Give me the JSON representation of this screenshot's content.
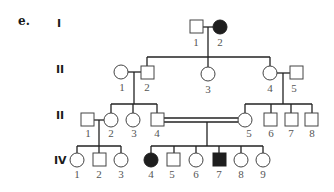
{
  "figure": {
    "part_label": "e.",
    "generations": [
      "I",
      "II",
      "II",
      "IV"
    ],
    "colors": {
      "affected": "#1e1e1e",
      "unaffected": "#ffffff",
      "line": "#222222"
    }
  },
  "gen1": {
    "members": [
      {
        "num": "1",
        "sex": "male",
        "affected": false
      },
      {
        "num": "2",
        "sex": "female",
        "affected": true
      }
    ]
  },
  "gen2": {
    "members": [
      {
        "num": "1",
        "sex": "female",
        "affected": false
      },
      {
        "num": "2",
        "sex": "male",
        "affected": false
      },
      {
        "num": "3",
        "sex": "female",
        "affected": false
      },
      {
        "num": "4",
        "sex": "female",
        "affected": false
      },
      {
        "num": "5",
        "sex": "male",
        "affected": false
      }
    ]
  },
  "gen3": {
    "members": [
      {
        "num": "1",
        "sex": "male",
        "affected": false
      },
      {
        "num": "2",
        "sex": "female",
        "affected": false
      },
      {
        "num": "3",
        "sex": "female",
        "affected": false
      },
      {
        "num": "4",
        "sex": "male",
        "affected": false
      },
      {
        "num": "5",
        "sex": "female",
        "affected": false
      },
      {
        "num": "6",
        "sex": "male",
        "affected": false
      },
      {
        "num": "7",
        "sex": "male",
        "affected": false
      },
      {
        "num": "8",
        "sex": "male",
        "affected": false
      }
    ],
    "consanguineous_mating": "III-4 x III-5"
  },
  "gen4": {
    "members": [
      {
        "num": "1",
        "sex": "female",
        "affected": false
      },
      {
        "num": "2",
        "sex": "male",
        "affected": false
      },
      {
        "num": "3",
        "sex": "female",
        "affected": false
      },
      {
        "num": "4",
        "sex": "female",
        "affected": true
      },
      {
        "num": "5",
        "sex": "male",
        "affected": false
      },
      {
        "num": "6",
        "sex": "female",
        "affected": false
      },
      {
        "num": "7",
        "sex": "male",
        "affected": true
      },
      {
        "num": "8",
        "sex": "female",
        "affected": false
      },
      {
        "num": "9",
        "sex": "female",
        "affected": false
      }
    ]
  }
}
